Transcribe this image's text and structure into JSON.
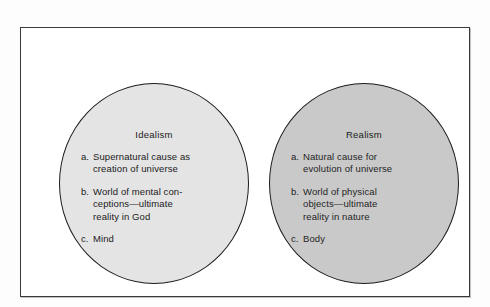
{
  "figure": {
    "name": "idealism-realism-venn-comparison",
    "frame": {
      "border_color": "#3a3a3a",
      "background": "#ffffff"
    }
  },
  "circles": [
    {
      "id": "idealism",
      "title": "Idealism",
      "fill_color": "#e4e4e4",
      "border_color": "#1c1c1c",
      "items": [
        {
          "marker": "a.",
          "text": "Supernatural cause as\ncreation of universe"
        },
        {
          "marker": "b.",
          "text": "World of mental con-\nceptions—ultimate\nreality in God"
        },
        {
          "marker": "c.",
          "text": "Mind"
        }
      ]
    },
    {
      "id": "realism",
      "title": "Realism",
      "fill_color": "#c9c9c9",
      "border_color": "#1c1c1c",
      "items": [
        {
          "marker": "a.",
          "text": "Natural cause for\nevolution of universe"
        },
        {
          "marker": "b.",
          "text": "World of physical\nobjects—ultimate\nreality in nature"
        },
        {
          "marker": "c.",
          "text": "Body"
        }
      ]
    }
  ]
}
